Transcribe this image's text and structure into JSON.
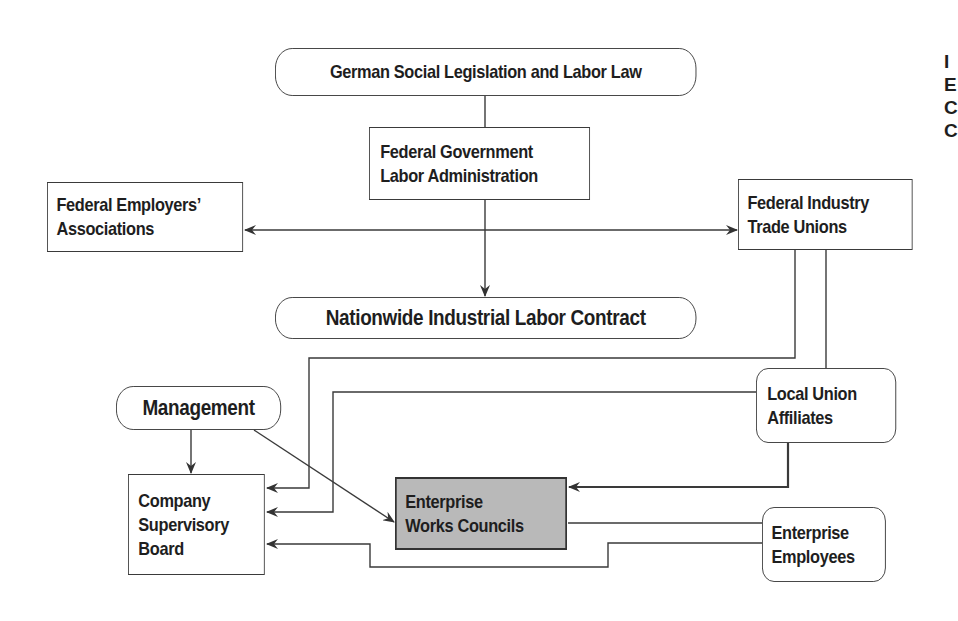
{
  "diagram": {
    "title": "",
    "nodes": {
      "social_legislation": {
        "label": "German Social Legislation and Labor Law",
        "shape": "pill"
      },
      "federal_government": {
        "line1": "Federal Government",
        "line2": "Labor Administration",
        "shape": "rect"
      },
      "employers_associations": {
        "line1": "Federal Employers’",
        "line2": "Associations",
        "shape": "rect"
      },
      "trade_unions": {
        "line1": "Federal Industry",
        "line2": "Trade Unions",
        "shape": "rect"
      },
      "labor_contract": {
        "label": "Nationwide Industrial Labor Contract",
        "shape": "pill"
      },
      "management": {
        "label": "Management",
        "shape": "pill"
      },
      "local_union": {
        "line1": "Local Union",
        "line2": "Affiliates",
        "shape": "rounded"
      },
      "supervisory_board": {
        "line1": "Company",
        "line2": "Supervisory",
        "line3": "Board",
        "shape": "rect"
      },
      "works_councils": {
        "line1": "Enterprise",
        "line2": "Works Councils",
        "shape": "rect-shaded"
      },
      "employees": {
        "line1": "Enterprise",
        "line2": "Employees",
        "shape": "rounded"
      }
    },
    "edges": [
      {
        "from": "German Social Legislation and Labor Law",
        "to": "Federal Government Labor Administration",
        "type": "line"
      },
      {
        "from": "Federal Government Labor Administration",
        "to": "Nationwide Industrial Labor Contract",
        "type": "arrow"
      },
      {
        "from": "Federal Employers’ Associations",
        "to": "Federal Industry Trade Unions",
        "type": "double-arrow"
      },
      {
        "from": "Federal Industry Trade Unions",
        "to": "Company Supervisory Board",
        "type": "arrow"
      },
      {
        "from": "Federal Industry Trade Unions",
        "to": "Local Union Affiliates",
        "type": "line"
      },
      {
        "from": "Local Union Affiliates",
        "to": "Company Supervisory Board",
        "type": "arrow"
      },
      {
        "from": "Local Union Affiliates",
        "to": "Enterprise Works Councils",
        "type": "arrow"
      },
      {
        "from": "Management",
        "to": "Company Supervisory Board",
        "type": "arrow"
      },
      {
        "from": "Management",
        "to": "Enterprise Works Councils",
        "type": "arrow"
      },
      {
        "from": "Enterprise Works Councils",
        "to": "Enterprise Employees",
        "type": "line"
      },
      {
        "from": "Enterprise Employees",
        "to": "Company Supervisory Board",
        "type": "arrow"
      }
    ],
    "colors": {
      "stroke": "#3a3a3a",
      "text": "#1e1e1e",
      "shaded_fill": "#b9b9b9",
      "background": "#ffffff"
    }
  },
  "cropped_edge_text": [
    "I",
    "E",
    "C",
    "C"
  ]
}
